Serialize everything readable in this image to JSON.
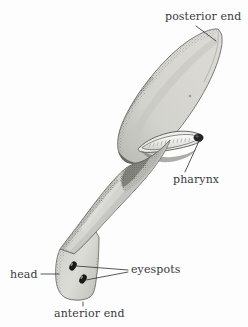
{
  "figure": {
    "background_color": "#fdfdfd",
    "ink_color": "#3a3a3a",
    "body_fill_color": "#d8d8d4",
    "body_outline_color": "#6e6e6a",
    "shading_color": "#8a8a85",
    "eyespot_color": "#1a1a1a",
    "pharynx_fill_color": "#f4f4f2",
    "pharynx_tip_color": "#242424"
  },
  "labels": {
    "posterior_end": "posterior end",
    "pharynx": "pharynx",
    "eyespots": "eyespots",
    "head": "head",
    "anterior_end": "anterior end"
  },
  "parts": {
    "posterior_blade": "posterior-body-blade",
    "mid_body": "mid-body-trunk",
    "head_lobe": "head-lobe",
    "pharynx_tube": "pharynx-tube",
    "eyespot_upper": "eyespot-upper",
    "eyespot_lower": "eyespot-lower",
    "body_dot": "body-surface-dot"
  },
  "leader_lines": {
    "posterior_end": "diagonal leader from label down-right to posterior tip",
    "pharynx": "diagonal leader from label up-right to pharynx tip",
    "eyespots_upper": "leader from upper eyespot right to label",
    "eyespots_lower": "leader from lower eyespot right to label",
    "head": "horizontal leader from label right to head lobe edge",
    "anterior_end": "vertical leader from label up to anterior edge"
  }
}
